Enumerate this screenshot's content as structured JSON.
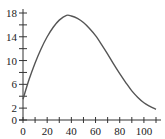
{
  "chart_data": {
    "type": "line",
    "title": "",
    "xlabel": "",
    "ylabel": "",
    "xlim": [
      0,
      110
    ],
    "ylim": [
      0,
      18
    ],
    "grid": false,
    "x_ticks": [
      0,
      10,
      20,
      30,
      40,
      50,
      60,
      70,
      80,
      90,
      100,
      110
    ],
    "x_tick_labels": [
      "0",
      "20",
      "40",
      "60",
      "80",
      "100"
    ],
    "x_tick_label_values": [
      0,
      20,
      40,
      60,
      80,
      100
    ],
    "y_ticks": [
      0,
      2,
      4,
      6,
      8,
      10,
      12,
      14,
      16,
      18
    ],
    "y_tick_labels": [
      "0",
      "2",
      "6",
      "10",
      "14",
      "18"
    ],
    "y_tick_label_values": [
      0,
      2,
      6,
      10,
      14,
      18
    ],
    "series": [
      {
        "name": "curve",
        "x": [
          0,
          5,
          10,
          15,
          20,
          25,
          30,
          36,
          40,
          45,
          50,
          55,
          60,
          65,
          70,
          75,
          80,
          85,
          90,
          95,
          100,
          105,
          110
        ],
        "y": [
          3.5,
          6.8,
          9.6,
          12.0,
          14.0,
          15.6,
          16.8,
          17.6,
          17.5,
          17.1,
          16.4,
          15.4,
          14.2,
          12.7,
          11.1,
          9.4,
          7.8,
          6.3,
          4.9,
          3.8,
          2.9,
          2.3,
          1.8
        ]
      }
    ]
  }
}
